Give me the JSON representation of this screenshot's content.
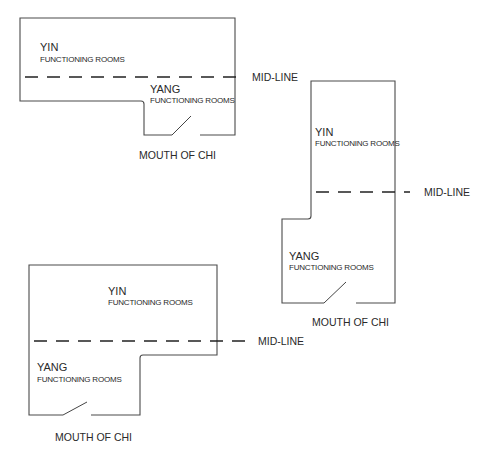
{
  "diagrams": [
    {
      "id": "top-left",
      "yin": {
        "title": "YIN",
        "subtitle": "FUNCTIONING ROOMS"
      },
      "yang": {
        "title": "YANG",
        "subtitle": "FUNCTIONING ROOMS"
      },
      "midline_label": "MID-LINE",
      "entrance_label": "MOUTH OF CHI"
    },
    {
      "id": "right",
      "yin": {
        "title": "YIN",
        "subtitle": "FUNCTIONING ROOMS"
      },
      "yang": {
        "title": "YANG",
        "subtitle": "FUNCTIONING ROOMS"
      },
      "midline_label": "MID-LINE",
      "entrance_label": "MOUTH OF CHI"
    },
    {
      "id": "bottom-left",
      "yin": {
        "title": "YIN",
        "subtitle": "FUNCTIONING ROOMS"
      },
      "yang": {
        "title": "YANG",
        "subtitle": "FUNCTIONING ROOMS"
      },
      "midline_label": "MID-LINE",
      "entrance_label": "MOUTH OF CHI"
    }
  ],
  "colors": {
    "line": "#4a4a4a",
    "text": "#2a2a2a",
    "background": "#ffffff"
  }
}
